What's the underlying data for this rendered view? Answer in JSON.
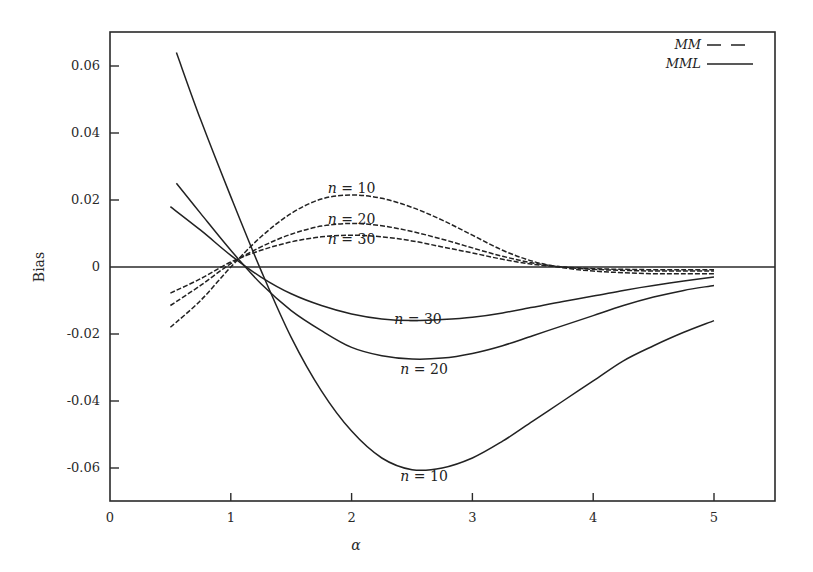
{
  "chart_data": {
    "type": "line",
    "title": "",
    "xlabel": "α",
    "ylabel": "Bias",
    "xlim": [
      0,
      5.5
    ],
    "ylim": [
      -0.07,
      0.07
    ],
    "grid": false,
    "legend_position": "top-right",
    "x_ticks": [
      0,
      1,
      2,
      3,
      4,
      5
    ],
    "x_tick_labels": [
      "0",
      "1",
      "2",
      "3",
      "4",
      "5"
    ],
    "y_ticks": [
      0.06,
      0.04,
      0.02,
      0,
      -0.02,
      -0.04,
      -0.06
    ],
    "y_tick_labels": [
      "0.06",
      "0.04",
      "0.02",
      "0",
      "-0.02",
      "-0.04",
      "-0.06"
    ],
    "zero_line": true,
    "legend": [
      {
        "label": "MM",
        "style": "dashed"
      },
      {
        "label": "MML",
        "style": "solid"
      }
    ],
    "x": [
      0.5,
      0.75,
      1.0,
      1.25,
      1.5,
      1.75,
      2.0,
      2.25,
      2.5,
      2.75,
      3.0,
      3.25,
      3.5,
      3.75,
      4.0,
      4.25,
      4.5,
      4.75,
      5.0
    ],
    "series": [
      {
        "name": "MML n = 10",
        "estimator": "MML",
        "n": 10,
        "style": "solid",
        "x": [
          0.55,
          0.75,
          1.0,
          1.25,
          1.5,
          1.75,
          2.0,
          2.25,
          2.5,
          2.75,
          3.0,
          3.25,
          3.5,
          3.75,
          4.0,
          4.25,
          4.5,
          4.75,
          5.0
        ],
        "values": [
          0.064,
          0.044,
          0.021,
          -0.001,
          -0.021,
          -0.037,
          -0.049,
          -0.057,
          -0.0605,
          -0.06,
          -0.057,
          -0.052,
          -0.046,
          -0.04,
          -0.034,
          -0.028,
          -0.0235,
          -0.0195,
          -0.016
        ]
      },
      {
        "name": "MML n = 20",
        "estimator": "MML",
        "n": 20,
        "style": "solid",
        "x": [
          0.55,
          0.75,
          1.0,
          1.25,
          1.5,
          1.75,
          2.0,
          2.25,
          2.5,
          2.75,
          3.0,
          3.25,
          3.5,
          3.75,
          4.0,
          4.25,
          4.5,
          4.75,
          5.0
        ],
        "values": [
          0.025,
          0.016,
          0.005,
          -0.005,
          -0.013,
          -0.019,
          -0.024,
          -0.0265,
          -0.0275,
          -0.0272,
          -0.0258,
          -0.0235,
          -0.0205,
          -0.0175,
          -0.0145,
          -0.0115,
          -0.009,
          -0.007,
          -0.0055
        ]
      },
      {
        "name": "MML n = 30",
        "estimator": "MML",
        "n": 30,
        "style": "solid",
        "x": [
          0.5,
          0.75,
          1.0,
          1.25,
          1.5,
          1.75,
          2.0,
          2.25,
          2.5,
          2.75,
          3.0,
          3.25,
          3.5,
          3.75,
          4.0,
          4.25,
          4.5,
          4.75,
          5.0
        ],
        "values": [
          0.018,
          0.011,
          0.0035,
          -0.003,
          -0.008,
          -0.0115,
          -0.014,
          -0.0155,
          -0.016,
          -0.0157,
          -0.015,
          -0.0137,
          -0.012,
          -0.0103,
          -0.0087,
          -0.007,
          -0.0055,
          -0.0042,
          -0.003
        ]
      },
      {
        "name": "MM n = 10",
        "estimator": "MM",
        "n": 10,
        "style": "dashed",
        "x": [
          0.5,
          0.75,
          1.0,
          1.25,
          1.5,
          1.75,
          2.0,
          2.25,
          2.5,
          2.75,
          3.0,
          3.25,
          3.5,
          3.75,
          4.0,
          4.25,
          4.5,
          4.75,
          5.0
        ],
        "values": [
          -0.018,
          -0.01,
          0.0,
          0.009,
          0.016,
          0.0203,
          0.0215,
          0.0205,
          0.0178,
          0.014,
          0.0095,
          0.005,
          0.0017,
          -0.0002,
          -0.0012,
          -0.0017,
          -0.002,
          -0.002,
          -0.002
        ]
      },
      {
        "name": "MM n = 20",
        "estimator": "MM",
        "n": 20,
        "style": "dashed",
        "x": [
          0.5,
          0.75,
          1.0,
          1.25,
          1.5,
          1.75,
          2.0,
          2.25,
          2.5,
          2.75,
          3.0,
          3.25,
          3.5,
          3.75,
          4.0,
          4.25,
          4.5,
          4.75,
          5.0
        ],
        "values": [
          -0.0115,
          -0.0055,
          0.001,
          0.006,
          0.0098,
          0.0122,
          0.013,
          0.0123,
          0.0106,
          0.0083,
          0.0057,
          0.0032,
          0.0012,
          0.0,
          -0.0007,
          -0.001,
          -0.0012,
          -0.0012,
          -0.0012
        ]
      },
      {
        "name": "MM n = 30",
        "estimator": "MM",
        "n": 30,
        "style": "dashed",
        "x": [
          0.5,
          0.75,
          1.0,
          1.25,
          1.5,
          1.75,
          2.0,
          2.25,
          2.5,
          2.75,
          3.0,
          3.25,
          3.5,
          3.75,
          4.0,
          4.25,
          4.5,
          4.75,
          5.0
        ],
        "values": [
          -0.0078,
          -0.0035,
          0.0015,
          0.005,
          0.0075,
          0.009,
          0.0095,
          0.009,
          0.0078,
          0.006,
          0.0042,
          0.0023,
          0.0008,
          0.0,
          -0.0005,
          -0.0007,
          -0.0008,
          -0.0008,
          -0.0008
        ]
      }
    ],
    "annotations": [
      {
        "text": "n = 10",
        "x": 2.0,
        "y": 0.0235,
        "target": "MM n = 10"
      },
      {
        "text": "n = 20",
        "x": 2.0,
        "y": 0.0142,
        "target": "MM n = 20"
      },
      {
        "text": "n = 30",
        "x": 2.0,
        "y": 0.0085,
        "target": "MM n = 30"
      },
      {
        "text": "n = 30",
        "x": 2.55,
        "y": -0.0155,
        "target": "MML n = 30"
      },
      {
        "text": "n = 20",
        "x": 2.6,
        "y": -0.0305,
        "target": "MML n = 20"
      },
      {
        "text": "n = 10",
        "x": 2.6,
        "y": -0.0625,
        "target": "MML n = 10"
      }
    ]
  },
  "labels": {
    "xlabel": "α",
    "ylabel": "Bias",
    "legend_mm": "MM",
    "legend_mml": "MML"
  }
}
